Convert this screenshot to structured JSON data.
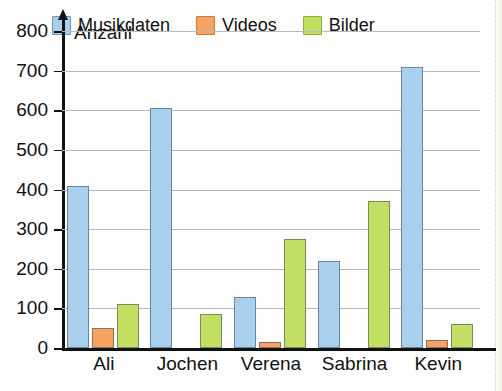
{
  "title_fragment": "",
  "axis_name": "Anzahl",
  "legend": {
    "items": [
      {
        "label": "Musikdaten",
        "color": "#a8cfec",
        "border": "#6f93b4"
      },
      {
        "label": "Videos",
        "color": "#f5a262",
        "border": "#c87a3c"
      },
      {
        "label": "Bilder",
        "color": "#c3df62",
        "border": "#8fae3a"
      }
    ]
  },
  "chart_data": {
    "type": "bar",
    "title": "",
    "xlabel": "",
    "ylabel": "Anzahl",
    "ylim": [
      0,
      800
    ],
    "yticks": [
      0,
      100,
      200,
      300,
      400,
      500,
      600,
      700,
      800
    ],
    "ytick_labels": [
      "0",
      "100",
      "200",
      "300",
      "400",
      "500",
      "600",
      "700",
      "800"
    ],
    "grid": "horizontal",
    "legend_position": "top-inside",
    "categories": [
      "Ali",
      "Jochen",
      "Verena",
      "Sabrina",
      "Kevin"
    ],
    "series": [
      {
        "name": "Musikdaten",
        "color": "#a8cfec",
        "values": [
          410,
          605,
          130,
          220,
          710
        ]
      },
      {
        "name": "Videos",
        "color": "#f5a262",
        "values": [
          50,
          0,
          15,
          0,
          20
        ]
      },
      {
        "name": "Bilder",
        "color": "#c3df62",
        "values": [
          110,
          85,
          275,
          370,
          60
        ]
      }
    ]
  }
}
